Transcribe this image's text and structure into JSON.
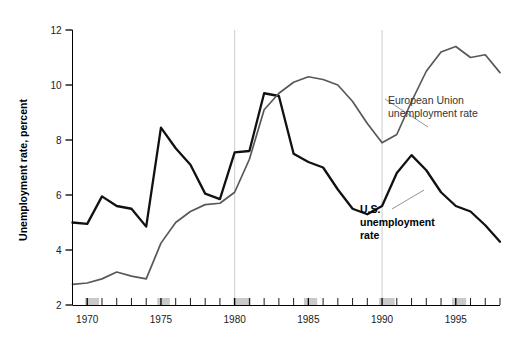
{
  "chart_data": {
    "type": "line",
    "title": "",
    "xlabel": "",
    "ylabel": "Unemployment rate, percent",
    "xlim": [
      1969,
      1998
    ],
    "ylim": [
      2,
      12
    ],
    "ytick_labels": [
      "2",
      "4",
      "6",
      "8",
      "10",
      "12"
    ],
    "yticks": [
      2,
      4,
      6,
      8,
      10,
      12
    ],
    "xtick_labels": [
      "1970",
      "1975",
      "1980",
      "1985",
      "1990",
      "1995"
    ],
    "xticks": [
      1970,
      1975,
      1980,
      1985,
      1990,
      1995
    ],
    "grid": "vertical-only",
    "vertical_gridlines": [
      1980,
      1990
    ],
    "legend_position": "inline-annotations",
    "x": [
      1969,
      1970,
      1971,
      1972,
      1973,
      1974,
      1975,
      1976,
      1977,
      1978,
      1979,
      1980,
      1981,
      1982,
      1983,
      1984,
      1985,
      1986,
      1987,
      1988,
      1989,
      1990,
      1991,
      1992,
      1993,
      1994,
      1995,
      1996,
      1997,
      1998
    ],
    "series": [
      {
        "name": "U.S. unemployment rate",
        "color": "#111111",
        "values": [
          5.0,
          4.95,
          5.95,
          5.6,
          5.5,
          4.85,
          8.45,
          7.7,
          7.1,
          6.05,
          5.85,
          7.55,
          7.6,
          9.7,
          9.6,
          7.5,
          7.2,
          7.0,
          6.2,
          5.5,
          5.3,
          5.6,
          6.8,
          7.45,
          6.9,
          6.1,
          5.6,
          5.4,
          4.9,
          4.3
        ]
      },
      {
        "name": "European Union unemployment rate",
        "color": "#585858",
        "values": [
          2.75,
          2.8,
          2.95,
          3.2,
          3.05,
          2.95,
          4.25,
          5.0,
          5.4,
          5.65,
          5.7,
          6.1,
          7.3,
          9.1,
          9.7,
          10.1,
          10.3,
          10.2,
          10.0,
          9.4,
          8.6,
          7.9,
          8.2,
          9.4,
          10.5,
          11.2,
          11.4,
          11.0,
          11.1,
          10.45
        ]
      }
    ],
    "annotations": [
      {
        "id": "eu-annotation",
        "lines": [
          "European Union",
          "unemployment rate"
        ],
        "style": "regular",
        "text_x": 388,
        "text_y": 104,
        "leader_from": [
          385,
          99
        ],
        "leader_to": [
          428,
          127
        ]
      },
      {
        "id": "us-annotation",
        "lines": [
          "U.S.",
          "unemployment",
          "rate"
        ],
        "style": "bold",
        "text_x": 360,
        "text_y": 213,
        "leader_from": [
          392,
          209
        ],
        "leader_to": [
          424,
          190
        ]
      }
    ],
    "recession_bands": [
      {
        "start": 1969.85,
        "end": 1970.8
      },
      {
        "start": 1974.75,
        "end": 1975.6
      },
      {
        "start": 1979.9,
        "end": 1981.1
      },
      {
        "start": 1984.7,
        "end": 1985.6
      },
      {
        "start": 1989.8,
        "end": 1990.85
      },
      {
        "start": 1994.75,
        "end": 1995.7
      }
    ],
    "colors": {
      "us_line": "#111111",
      "eu_line": "#585858",
      "gridline": "#bfbfbf",
      "recession_band": "#c9c9c9",
      "axis": "#000000",
      "background": "#ffffff"
    }
  },
  "axis": {
    "y_title": "Unemployment rate, percent"
  }
}
